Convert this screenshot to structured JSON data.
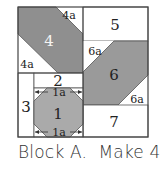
{
  "block": {
    "name": "Block A",
    "pieces": {
      "p1": "1",
      "p1a_top": "1a",
      "p1a_bottom": "1a",
      "p2": "2",
      "p3": "3",
      "p4": "4",
      "p4a_top": "4a",
      "p4a_bottom": "4a",
      "p5": "5",
      "p6": "6",
      "p6a_top": "6a",
      "p6a_bottom": "6a",
      "p7": "7"
    },
    "colors": {
      "piece4": "#8f8f8f",
      "piece6": "#9a9a9a",
      "piece1": "#aaaaaa",
      "outline": "#444444",
      "background": "#ffffff"
    }
  },
  "caption": {
    "block_label": "Block A.",
    "make_label": "Make 4"
  }
}
